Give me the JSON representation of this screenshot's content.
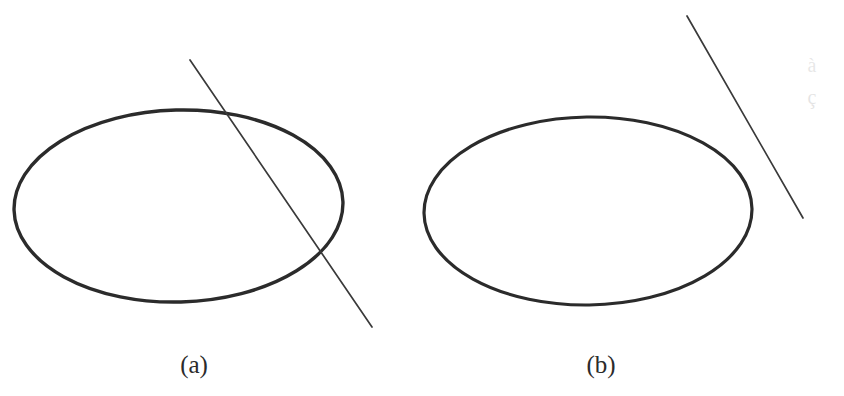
{
  "figure": {
    "background_color": "#ffffff",
    "stroke_color": "#2b2b2b",
    "line_stroke_color": "#3a3a3a",
    "width": 844,
    "height": 396,
    "panels": [
      {
        "id": "a",
        "caption": "(a)",
        "caption_center_x": 194,
        "caption_baseline_y": 375,
        "description": "ellipse intersected by a secant line in two points",
        "ellipse": {
          "name": "ellipse-a",
          "cx": 178.5,
          "cy": 206,
          "rx": 164.5,
          "ry": 96,
          "stroke_width": 3.4,
          "rotation_deg": -1.5
        },
        "line": {
          "name": "secant-line-a",
          "x1": 190,
          "y1": 60,
          "x2": 372,
          "y2": 327,
          "stroke_width": 1.7,
          "relation": "secant",
          "intersections": [
            {
              "x": 232,
              "y": 112
            },
            {
              "x": 322,
              "y": 250
            }
          ]
        }
      },
      {
        "id": "b",
        "caption": "(b)",
        "caption_center_x": 601,
        "caption_baseline_y": 375,
        "description": "ellipse with a non-intersecting line outside to the upper right",
        "ellipse": {
          "name": "ellipse-b",
          "cx": 588,
          "cy": 211,
          "rx": 164,
          "ry": 94,
          "stroke_width": 3.2,
          "rotation_deg": -0.8
        },
        "line": {
          "name": "external-line-b",
          "x1": 687,
          "y1": 16,
          "x2": 803,
          "y2": 218,
          "stroke_width": 1.7,
          "relation": "disjoint",
          "intersections": []
        }
      }
    ],
    "artifacts": [
      {
        "name": "scan-ghost-mark-upper",
        "x": 812,
        "y": 72,
        "opacity": 0.09,
        "glyph": "à"
      },
      {
        "name": "scan-ghost-mark-lower",
        "x": 812,
        "y": 104,
        "opacity": 0.1,
        "glyph": "ç"
      }
    ]
  }
}
